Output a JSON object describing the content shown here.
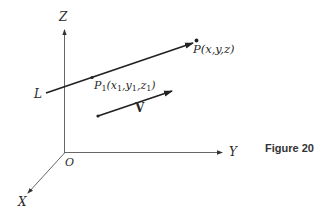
{
  "figure": {
    "caption": "Figure 20",
    "axes": {
      "z_label": "Z",
      "y_label": "Y",
      "x_label": "X",
      "origin_label": "O"
    },
    "line": {
      "label": "L",
      "point_label": "P(x,y,z)",
      "fixed_point": {
        "name": "P",
        "sub": "1",
        "coords": [
          {
            "v": "x",
            "sub": "1"
          },
          {
            "v": "y",
            "sub": "1"
          },
          {
            "v": "z",
            "sub": "1"
          }
        ]
      }
    },
    "vector": {
      "label": "V"
    },
    "colors": {
      "ink": "#2a2a2a",
      "axis": "#555555",
      "background": "#ffffff"
    }
  }
}
